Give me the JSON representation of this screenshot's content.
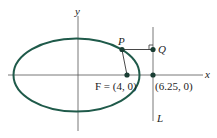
{
  "diagram": {
    "axis_x_label": "x",
    "axis_y_label": "y",
    "point_P": "P",
    "point_Q": "Q",
    "focus_label": "F = (4, 0)",
    "directrix_point_label": "(6.25, 0)",
    "directrix_label": "L",
    "colors": {
      "ellipse": "#1f5a4a",
      "axes": "#555555",
      "points": "#1a3d33"
    }
  }
}
